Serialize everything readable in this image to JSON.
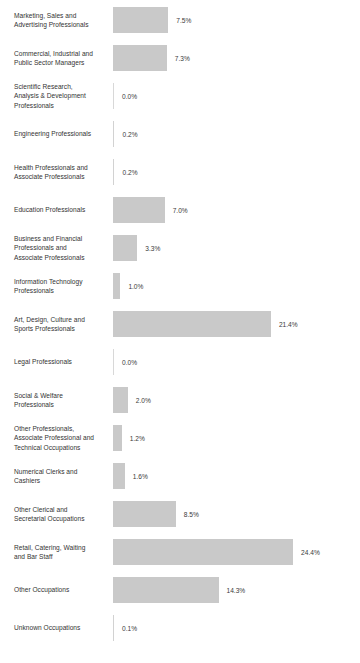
{
  "chart_data": {
    "type": "bar",
    "title": "",
    "xlabel": "",
    "ylabel": "",
    "orientation": "horizontal",
    "grid": false,
    "legend": null,
    "value_suffix": "%",
    "xlim": [
      0,
      24.4
    ],
    "categories": [
      "Marketing, Sales and\nAdvertising Professionals",
      "Commercial, Industrial and\nPublic Sector Managers",
      "Scientific Research,\nAnalysis & Development\nProfessionals",
      "Engineering Professionals",
      "Health Professionals and\nAssociate Professionals",
      "Education Professionals",
      "Business and Financial\nProfessionals and\nAssociate Professionals",
      "Information Technology\nProfessionals",
      "Art, Design, Culture and\nSports Professionals",
      "Legal Professionals",
      "Social & Welfare\nProfessionals",
      "Other Professionals,\nAssociate Professional and\nTechnical Occupations",
      "Numerical Clerks and\nCashiers",
      "Other Clerical and\nSecretarial Occupations",
      "Retail, Catering, Waiting\nand Bar Staff",
      "Other Occupations",
      "Unknown Occupations"
    ],
    "values": [
      7.5,
      7.3,
      0.0,
      0.2,
      0.2,
      7.0,
      3.3,
      1.0,
      21.4,
      0.0,
      2.0,
      1.2,
      1.6,
      8.5,
      24.4,
      14.3,
      0.1
    ],
    "value_labels": [
      "7.5%",
      "7.3%",
      "0.0%",
      "0.2%",
      "0.2%",
      "7.0%",
      "3.3%",
      "1.0%",
      "21.4%",
      "0.0%",
      "2.0%",
      "1.2%",
      "1.6%",
      "8.5%",
      "24.4%",
      "14.3%",
      "0.1%"
    ],
    "bar_color": "#c9c9c9",
    "label_color": "#333333",
    "background_color": "#ffffff"
  },
  "layout": {
    "bar_origin_x": 113,
    "px_per_percent": 7.38,
    "row_pitch": 38,
    "first_row_top": 1,
    "bar_height": 26,
    "value_gap": 8
  }
}
